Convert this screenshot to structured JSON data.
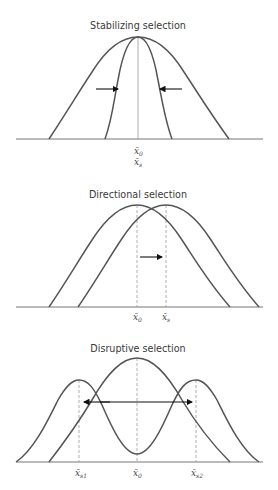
{
  "panels": [
    {
      "title": "Stabilizing selection",
      "labels": {
        "x0": "x̄",
        "x0_sub": "0",
        "xs": "x̄",
        "xs_sub": "s"
      }
    },
    {
      "title": "Directional selection",
      "labels": {
        "x0": "x̄",
        "x0_sub": "0",
        "xs": "x̄",
        "xs_sub": "s"
      }
    },
    {
      "title": "Disruptive selection",
      "labels": {
        "xs1": "x̄",
        "xs1_sub": "s1",
        "x0": "x̄",
        "x0_sub": "0",
        "xs2": "x̄",
        "xs2_sub": "s2"
      }
    }
  ],
  "colors": {
    "curve": "#555555",
    "arrow": "#111111",
    "guide": "#999999"
  }
}
